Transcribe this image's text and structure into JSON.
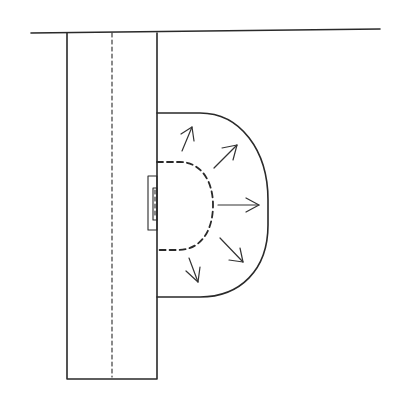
{
  "diagram": {
    "colors": {
      "line": "#2a2a2a",
      "background": "#ffffff"
    },
    "elements": {
      "top_wall": {
        "label": ""
      },
      "vertical_column": {
        "label": ""
      },
      "center_dashed_line": {
        "label": ""
      },
      "wall_fixture": {
        "label": ""
      },
      "outer_zone": {
        "label": ""
      },
      "inner_dashed_zone": {
        "label": ""
      },
      "arrows": [
        {
          "name": "arrow-up-right-1",
          "direction": "north-northeast"
        },
        {
          "name": "arrow-up-right-2",
          "direction": "northeast"
        },
        {
          "name": "arrow-right",
          "direction": "east"
        },
        {
          "name": "arrow-down-right",
          "direction": "southeast"
        },
        {
          "name": "arrow-down",
          "direction": "south-southeast"
        }
      ]
    }
  }
}
